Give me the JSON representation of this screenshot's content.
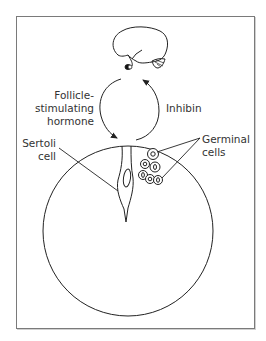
{
  "diagram": {
    "labels": {
      "fsh_line1": "Follicle-",
      "fsh_line2": "stimulating",
      "fsh_line3": "hormone",
      "inhibin": "Inhibin",
      "sertoli_line1": "Sertoli",
      "sertoli_line2": "cell",
      "germinal_line1": "Germinal",
      "germinal_line2": "cells"
    },
    "elements": {
      "top": "pituitary-brain",
      "cycle": "feedback-loop",
      "bottom": "seminiferous-tubule"
    },
    "colors": {
      "line": "#222222",
      "text": "#333333",
      "frame": "#7a7a7a"
    }
  }
}
